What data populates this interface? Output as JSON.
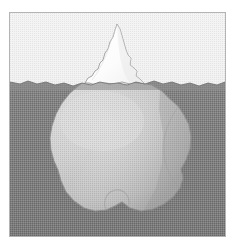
{
  "image": {
    "title": "Iceberg cross-section",
    "subject": "iceberg",
    "style": "grayscale halftone illustration",
    "width": 236,
    "height": 252
  },
  "frame": {
    "border_color": "#b4b4b4",
    "left": 9,
    "top": 12,
    "width": 217,
    "height": 225
  },
  "palette": {
    "page_background": "#ffffff",
    "sky": "#efefef",
    "sky_shade": "#e4e4e4",
    "water": "#808080",
    "water_deep": "#7a7a7a",
    "water_surface_band": "#8c8c8c",
    "ice_above": "#fdfdfd",
    "ice_above_shade": "#f2f2f2",
    "ice_below": "#c8c8c8",
    "ice_below_light": "#d6d6d6",
    "ice_below_shadow": "#a9a9a9",
    "outline": "#9a9a9a",
    "outline_dark": "#6f6f6f"
  },
  "scene": {
    "waterline_y": 70,
    "regions": [
      {
        "name": "sky",
        "label": "Sky above the waterline",
        "color": "#efefef"
      },
      {
        "name": "sea",
        "label": "Sea below the waterline",
        "color": "#808080"
      },
      {
        "name": "iceberg-tip",
        "label": "Iceberg visible above water",
        "color": "#fdfdfd"
      },
      {
        "name": "iceberg-submerged",
        "label": "Iceberg mass hidden below water",
        "color": "#c8c8c8"
      }
    ],
    "iceberg": {
      "peak_apex": {
        "x": 107,
        "y": 11
      },
      "tip_span_x": [
        75,
        135
      ],
      "submerged_span_x": [
        40,
        185
      ],
      "submerged_bottom_y": 205
    },
    "waterline_path": "M0,69 L10,71 L18,68 L27,71 L36,69 L45,72 L54,70 L63,73 L72,70 L81,72 L90,69 L99,71 L108,70 L117,72 L126,69 L135,71 L144,68 L153,71 L162,69 L171,72 L180,70 L189,73 L198,70 L207,72 L215,69 L215,223 L0,223 Z",
    "tip_path": "M75,70 L78,65 L82,63 L85,58 L88,56 L90,50 L93,47 L95,40 L98,36 L100,29 L103,24 L105,17 L107,11 L110,16 L112,23 L114,30 L116,37 L118,42 L121,45 L120,52 L124,55 L127,58 L126,63 L130,66 L133,69 L135,71 L120,71 L112,69 L104,71 L95,70 L86,72 L79,70 Z",
    "submerged_path": "M72,70 L90,69 L112,69 L130,70 L142,72 L152,78 L160,86 L168,93 L174,102 L179,112 L181,124 L180,136 L176,147 L171,156 L173,165 L170,175 L163,184 L154,191 L143,196 L131,198 L120,195 L112,189 L105,193 L96,197 L85,198 L74,195 L64,188 L56,179 L51,168 L48,157 L44,148 L41,137 L40,125 L42,113 L46,101 L52,90 L60,80 L68,73 Z"
  },
  "texture": {
    "name": "halftone-dither",
    "enabled": true,
    "opacity": 0.16
  }
}
